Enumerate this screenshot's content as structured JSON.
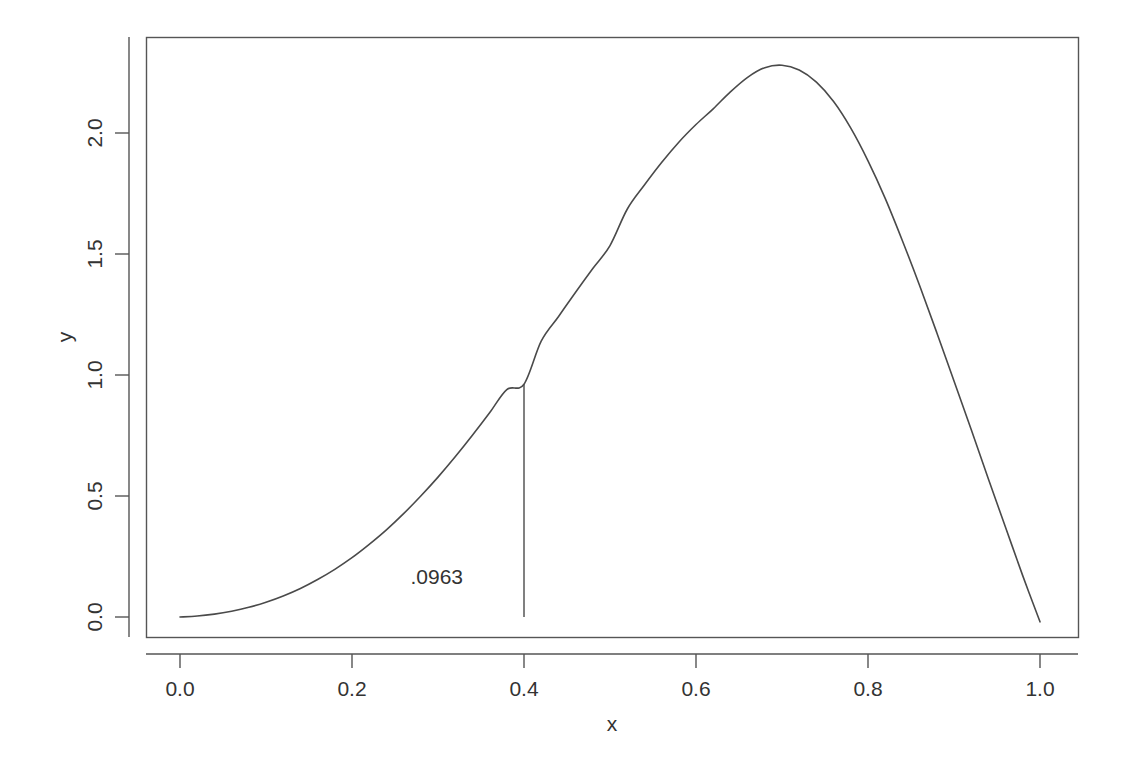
{
  "figure": {
    "background_color": "#ffffff",
    "foreground_color": "#4a4a4a",
    "width": 1136,
    "height": 766
  },
  "chart_data": {
    "type": "line",
    "title": "",
    "subtitle": "",
    "xlabel": "x",
    "ylabel": "y",
    "xlim": [
      -0.03,
      1.03
    ],
    "ylim": [
      -0.07,
      2.35
    ],
    "grid": false,
    "legend": null,
    "xticks": [
      0.0,
      0.2,
      0.4,
      0.6,
      0.8,
      1.0
    ],
    "xticklabels": [
      "0.0",
      "0.2",
      "0.4",
      "0.6",
      "0.8",
      "1.0"
    ],
    "yticks": [
      0.0,
      0.5,
      1.0,
      1.5,
      2.0
    ],
    "yticklabels": [
      "0.0",
      "0.5",
      "1.0",
      "1.5",
      "2.0"
    ],
    "box_style": "full-frame",
    "series": [
      {
        "name": "density",
        "type": "line",
        "x": [
          0.0,
          0.02,
          0.04,
          0.06,
          0.08,
          0.1,
          0.12,
          0.14,
          0.16,
          0.18,
          0.2,
          0.22,
          0.24,
          0.26,
          0.28,
          0.3,
          0.32,
          0.34,
          0.36,
          0.38,
          0.4,
          0.42,
          0.44,
          0.46,
          0.48,
          0.5,
          0.52,
          0.54,
          0.56,
          0.58,
          0.6,
          0.62,
          0.64,
          0.66,
          0.68,
          0.7,
          0.72,
          0.74,
          0.76,
          0.78,
          0.8,
          0.82,
          0.84,
          0.86,
          0.88,
          0.9,
          0.92,
          0.94,
          0.96,
          0.98,
          1.0
        ],
        "y": [
          0.0,
          0.004,
          0.012,
          0.024,
          0.04,
          0.061,
          0.087,
          0.118,
          0.155,
          0.197,
          0.245,
          0.3,
          0.36,
          0.427,
          0.5,
          0.578,
          0.662,
          0.751,
          0.844,
          0.94,
          0.962,
          1.14,
          1.241,
          1.342,
          1.44,
          1.535,
          1.685,
          1.785,
          1.878,
          1.962,
          2.035,
          2.1,
          2.17,
          2.23,
          2.27,
          2.28,
          2.26,
          2.21,
          2.13,
          2.02,
          1.885,
          1.73,
          1.555,
          1.37,
          1.175,
          0.975,
          0.775,
          0.57,
          0.37,
          0.17,
          -0.02
        ]
      }
    ],
    "annotations": [
      {
        "name": "area-label",
        "text": ".0963",
        "x": 0.268,
        "y": 0.135,
        "anchor": "start"
      }
    ],
    "segments": [
      {
        "name": "vertical-marker-at-0.4",
        "x0": 0.4,
        "y0": 0.0,
        "x1": 0.4,
        "y1": 0.962
      }
    ]
  }
}
